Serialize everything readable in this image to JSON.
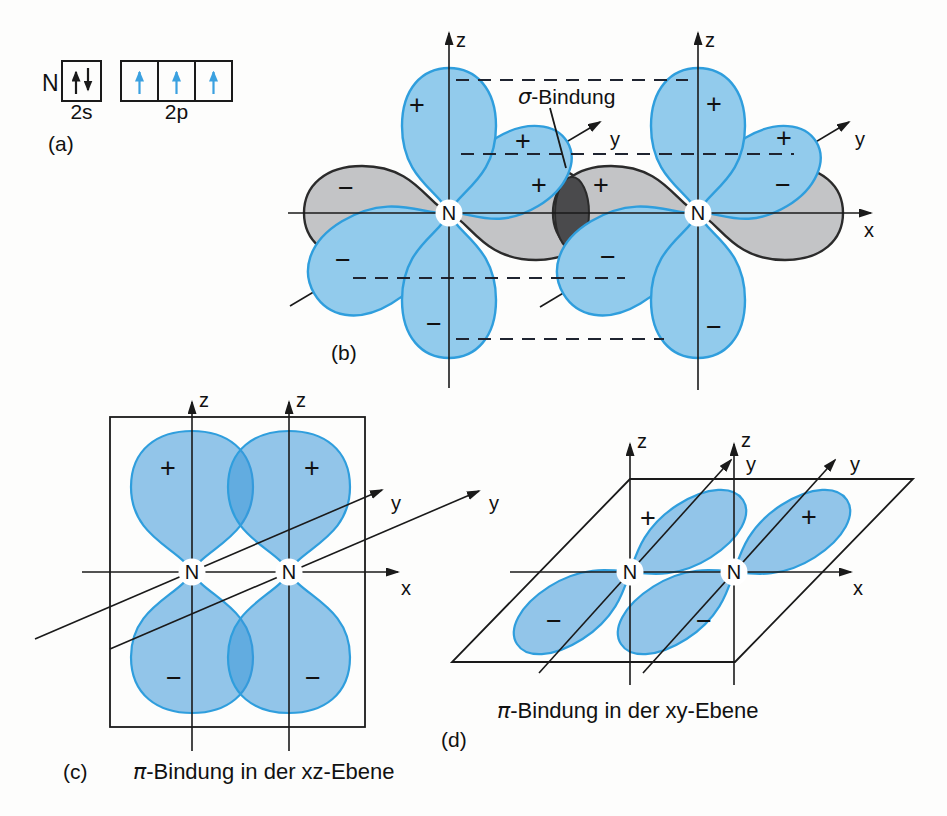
{
  "atom": "N",
  "symbols": {
    "plus": "+",
    "minus": "−"
  },
  "axes": {
    "x": "x",
    "y": "y",
    "z": "z"
  },
  "panel_a": {
    "tag": "(a)",
    "element": "N",
    "orbitals": [
      {
        "label": "2s",
        "electrons": [
          "up",
          "down"
        ],
        "electron_color": "black"
      },
      {
        "label": "2p",
        "electrons": [
          "up",
          "up",
          "up"
        ],
        "electron_color": "blue"
      }
    ]
  },
  "panel_b": {
    "tag": "(b)",
    "sigma": {
      "symbol": "σ",
      "label": "-Bindung"
    }
  },
  "panel_c": {
    "tag": "(c)",
    "caption": {
      "symbol": "π",
      "label": "-Bindung in der xz-Ebene"
    }
  },
  "panel_d": {
    "tag": "(d)",
    "caption": {
      "symbol": "π",
      "label": "-Bindung in der xy-Ebene"
    }
  },
  "colors": {
    "lobe_blue_fill": "#92cbec",
    "lobe_blue_stroke": "#2f9edd",
    "lobe_grey_fill": "#c3c4c6",
    "lobe_grey_stroke": "#2b2b2b",
    "sigma_overlap_dark": "#4a4a4c",
    "electron_arrow_blue": "#3ba1e0",
    "ink": "#1a1a1a"
  }
}
